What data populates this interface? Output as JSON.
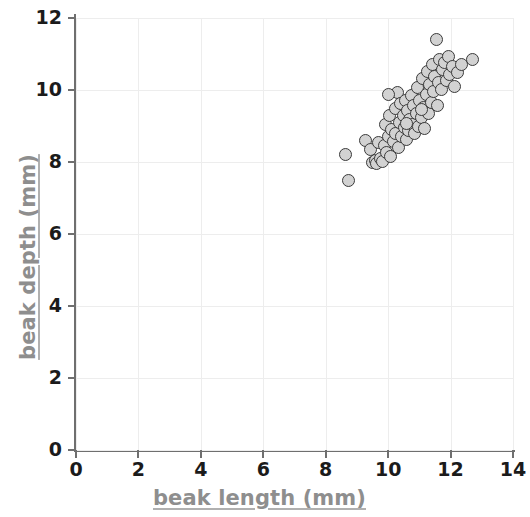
{
  "chart_data": {
    "type": "scatter",
    "title": "",
    "xlabel": "beak length (mm)",
    "ylabel": "beak depth (mm)",
    "xlim": [
      0,
      14
    ],
    "ylim": [
      0,
      12
    ],
    "xticks": [
      0,
      2,
      4,
      6,
      8,
      10,
      12,
      14
    ],
    "yticks": [
      0,
      2,
      4,
      6,
      8,
      10,
      12
    ],
    "xtick_labels": [
      "0",
      "2",
      "4",
      "6",
      "8",
      "10",
      "12",
      "14"
    ],
    "ytick_labels": [
      "0",
      "2",
      "4",
      "6",
      "8",
      "10",
      "12"
    ],
    "grid": true,
    "legend": null,
    "marker": {
      "shape": "circle",
      "fill_color": "#d2d2d2",
      "edge_color": "#3a3a3a",
      "size_px": 13
    },
    "series": [
      {
        "name": "finches",
        "points": [
          [
            8.62,
            8.2
          ],
          [
            8.72,
            7.48
          ],
          [
            9.28,
            8.6
          ],
          [
            9.45,
            8.34
          ],
          [
            9.5,
            7.98
          ],
          [
            9.58,
            8.05
          ],
          [
            9.62,
            7.95
          ],
          [
            9.7,
            8.55
          ],
          [
            9.75,
            8.1
          ],
          [
            9.82,
            8.02
          ],
          [
            9.88,
            8.46
          ],
          [
            9.92,
            9.05
          ],
          [
            9.95,
            8.26
          ],
          [
            10.0,
            8.7
          ],
          [
            10.05,
            9.3
          ],
          [
            10.08,
            8.14
          ],
          [
            10.12,
            8.9
          ],
          [
            10.18,
            8.58
          ],
          [
            10.22,
            9.5
          ],
          [
            10.25,
            8.8
          ],
          [
            10.3,
            9.92
          ],
          [
            10.32,
            8.4
          ],
          [
            10.36,
            9.1
          ],
          [
            10.4,
            9.62
          ],
          [
            10.44,
            8.72
          ],
          [
            10.48,
            9.28
          ],
          [
            10.52,
            8.96
          ],
          [
            10.55,
            9.7
          ],
          [
            10.58,
            8.62
          ],
          [
            10.62,
            9.42
          ],
          [
            10.66,
            8.88
          ],
          [
            10.7,
            9.18
          ],
          [
            10.74,
            9.86
          ],
          [
            10.78,
            9.04
          ],
          [
            10.82,
            9.58
          ],
          [
            10.86,
            8.8
          ],
          [
            10.9,
            9.34
          ],
          [
            10.94,
            10.08
          ],
          [
            10.98,
            9.0
          ],
          [
            11.02,
            9.72
          ],
          [
            11.06,
            9.24
          ],
          [
            11.1,
            10.32
          ],
          [
            11.14,
            9.52
          ],
          [
            11.18,
            8.94
          ],
          [
            11.22,
            9.88
          ],
          [
            11.26,
            10.52
          ],
          [
            11.3,
            9.36
          ],
          [
            11.34,
            10.14
          ],
          [
            11.38,
            9.66
          ],
          [
            11.42,
            10.7
          ],
          [
            11.46,
            9.96
          ],
          [
            11.5,
            10.38
          ],
          [
            11.54,
            11.4
          ],
          [
            11.58,
            9.58
          ],
          [
            11.62,
            10.2
          ],
          [
            11.66,
            10.86
          ],
          [
            11.7,
            10.02
          ],
          [
            11.74,
            10.58
          ],
          [
            11.8,
            10.76
          ],
          [
            11.86,
            10.26
          ],
          [
            11.92,
            10.94
          ],
          [
            11.98,
            10.44
          ],
          [
            12.06,
            10.66
          ],
          [
            12.14,
            10.1
          ],
          [
            12.22,
            10.48
          ],
          [
            12.36,
            10.72
          ],
          [
            12.7,
            10.84
          ],
          [
            10.02,
            9.88
          ],
          [
            10.6,
            9.06
          ],
          [
            11.08,
            9.46
          ]
        ]
      }
    ]
  }
}
